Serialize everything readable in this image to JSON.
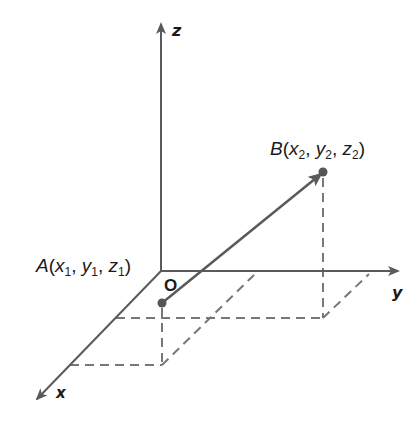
{
  "diagram": {
    "type": "3d-coordinate-system",
    "axes": {
      "z": {
        "label": "z"
      },
      "y": {
        "label": "y"
      },
      "x": {
        "label": "x"
      }
    },
    "origin": {
      "label": "O"
    },
    "points": {
      "A": {
        "name": "A",
        "open": "(",
        "x": "x",
        "x_sub": "1",
        "y": "y",
        "y_sub": "1",
        "z": "z",
        "z_sub": "1",
        "close": ")"
      },
      "B": {
        "name": "B",
        "open": "(",
        "x": "x",
        "x_sub": "2",
        "y": "y",
        "y_sub": "2",
        "z": "z",
        "z_sub": "2",
        "close": ")"
      }
    },
    "vector": {
      "from": "A",
      "to": "B"
    },
    "colors": {
      "line": "#5a5a5a",
      "dash": "#777777",
      "point": "#555555",
      "text": "#1a1a1a"
    }
  }
}
